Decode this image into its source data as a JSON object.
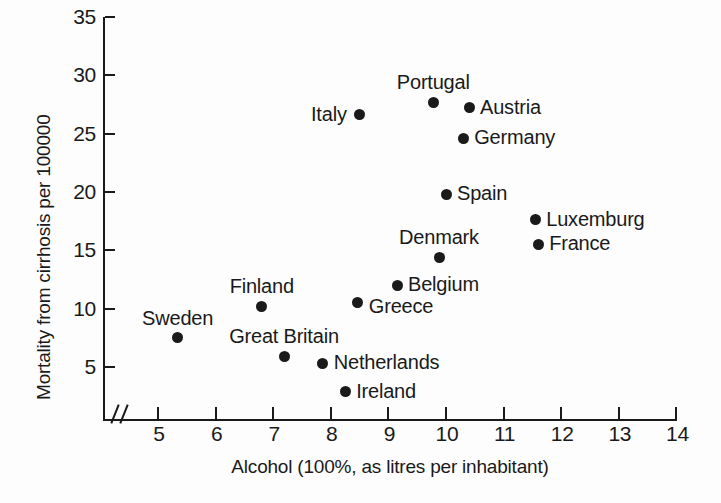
{
  "chart_data": {
    "type": "scatter",
    "title": "",
    "xlabel": "Alcohol (100%, as litres per inhabitant)",
    "ylabel": "Mortality from cirrhosis per 100000",
    "xlim": [
      4.6,
      14.2
    ],
    "ylim": [
      0,
      35
    ],
    "xticks": [
      "5",
      "6",
      "7",
      "8",
      "9",
      "10",
      "11",
      "12",
      "13",
      "14"
    ],
    "xtick_values": [
      5,
      6,
      7,
      8,
      9,
      10,
      11,
      12,
      13,
      14
    ],
    "yticks": [
      "5",
      "10",
      "15",
      "20",
      "25",
      "30",
      "35"
    ],
    "ytick_values": [
      5,
      10,
      15,
      20,
      25,
      30,
      35
    ],
    "grid": false,
    "legend": "none",
    "axis_break": "x-axis break between origin and 5",
    "marker": "filled-circle",
    "marker_color": "#1a1a1a",
    "points": [
      {
        "label": "Portugal",
        "x": 9.78,
        "y": 27.7,
        "label_pos": "above"
      },
      {
        "label": "Italy",
        "x": 8.49,
        "y": 26.6,
        "label_pos": "left"
      },
      {
        "label": "Austria",
        "x": 10.4,
        "y": 27.2,
        "label_pos": "right"
      },
      {
        "label": "Germany",
        "x": 10.3,
        "y": 24.6,
        "label_pos": "right"
      },
      {
        "label": "Spain",
        "x": 10.0,
        "y": 19.8,
        "label_pos": "right"
      },
      {
        "label": "Luxemburg",
        "x": 11.55,
        "y": 17.6,
        "label_pos": "right"
      },
      {
        "label": "France",
        "x": 11.6,
        "y": 15.5,
        "label_pos": "right"
      },
      {
        "label": "Denmark",
        "x": 9.88,
        "y": 14.4,
        "label_pos": "above"
      },
      {
        "label": "Belgium",
        "x": 9.15,
        "y": 12.0,
        "label_pos": "right"
      },
      {
        "label": "Greece",
        "x": 8.47,
        "y": 10.5,
        "label_pos": "right-below"
      },
      {
        "label": "Finland",
        "x": 6.8,
        "y": 10.2,
        "label_pos": "above"
      },
      {
        "label": "Sweden",
        "x": 5.34,
        "y": 7.5,
        "label_pos": "above"
      },
      {
        "label": "Great Britain",
        "x": 7.19,
        "y": 5.9,
        "label_pos": "above"
      },
      {
        "label": "Netherlands",
        "x": 7.86,
        "y": 5.3,
        "label_pos": "right"
      },
      {
        "label": "Ireland",
        "x": 8.25,
        "y": 2.9,
        "label_pos": "right"
      }
    ]
  }
}
